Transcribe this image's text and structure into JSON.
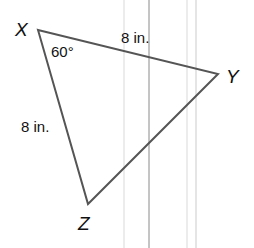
{
  "diagram": {
    "type": "triangle",
    "vertices": [
      {
        "name": "X",
        "x": 38,
        "y": 30
      },
      {
        "name": "Y",
        "x": 218,
        "y": 74
      },
      {
        "name": "Z",
        "x": 88,
        "y": 204
      }
    ],
    "labels": {
      "vertex_x": "X",
      "vertex_y": "Y",
      "vertex_z": "Z",
      "side_xy": "8 in.",
      "side_xz": "8 in.",
      "angle_x": "60°"
    },
    "colors": {
      "triangle_stroke": "#555555",
      "text": "#111111",
      "guide_line_dark": "#8a8a8a",
      "guide_line_light": "#e0e0e0"
    }
  }
}
